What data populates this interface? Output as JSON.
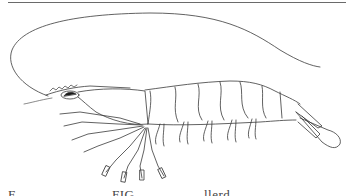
{
  "page": {
    "type": "scanned-document-figure",
    "top_rule": true
  },
  "figure": {
    "parts": [
      "antenna",
      "rostrum",
      "eye",
      "carapace",
      "abdominal-segments",
      "pleopods",
      "pereiopods",
      "telson",
      "uropods"
    ],
    "stroke_color": "#3a3a3a",
    "background": "#ffffff"
  },
  "caption": {
    "clipped": true,
    "fragments": [
      "F",
      "FIG",
      "llerd"
    ]
  }
}
